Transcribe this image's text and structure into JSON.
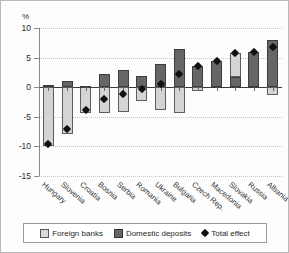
{
  "chart_data": {
    "type": "bar",
    "title": "",
    "subtitle": "",
    "xlabel": "",
    "ylabel": "%",
    "ylim": [
      -15,
      10
    ],
    "yticks": [
      10,
      5,
      0,
      -5,
      -10,
      -15
    ],
    "ytick_labels": [
      "10",
      "5",
      "0",
      "-5",
      "-10",
      "-15"
    ],
    "grid": true,
    "stacked": true,
    "legend_position": "bottom",
    "categories": [
      "Hungary",
      "Slovenia",
      "Croatia",
      "Bosnia",
      "Serbia",
      "Romania",
      "Ukraine",
      "Bulgaria",
      "Czech Rep.",
      "Macedonia",
      "Slovakia",
      "Russia",
      "Albania"
    ],
    "series": [
      {
        "name": "Foreign banks",
        "color": "#d4d4d4",
        "values": [
          -10.0,
          -7.9,
          -4.3,
          -4.3,
          -4.2,
          -2.4,
          -3.8,
          -4.3,
          -0.6,
          0.0,
          4.0,
          0.0,
          -1.3
        ]
      },
      {
        "name": "Domestic deposits",
        "color": "#666666",
        "values": [
          0.4,
          1.0,
          0.2,
          2.2,
          2.9,
          1.9,
          4.0,
          6.4,
          3.6,
          4.4,
          1.8,
          5.9,
          8.0
        ]
      }
    ],
    "markers": {
      "name": "Total effect",
      "color": "#111111",
      "values": [
        -9.6,
        -7.1,
        -3.9,
        -2.0,
        -1.2,
        -0.3,
        0.5,
        2.3,
        3.5,
        4.4,
        5.8,
        5.9,
        6.8
      ]
    }
  },
  "legend": {
    "entries": [
      {
        "label": "Foreign banks",
        "icon": "square-light-swatch"
      },
      {
        "label": "Domestic deposits",
        "icon": "square-dark-swatch"
      },
      {
        "label": "Total effect",
        "icon": "diamond-marker"
      }
    ]
  }
}
